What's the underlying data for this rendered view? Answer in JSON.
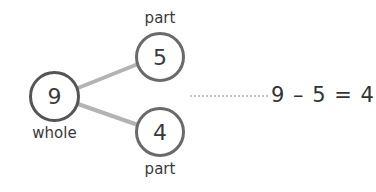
{
  "diagram": {
    "type": "part-whole number bond",
    "whole": {
      "label": "whole",
      "value": "9"
    },
    "parts": [
      {
        "label": "part",
        "value": "5"
      },
      {
        "label": "part",
        "value": "4"
      }
    ],
    "equation": "9 – 5 = 4",
    "colors": {
      "connector": "#b3b3b3",
      "whole_circle": "#555555",
      "part_circle": "#6a6a6a",
      "dotted_leader": "#c4c4c4",
      "text": "#333333"
    }
  }
}
